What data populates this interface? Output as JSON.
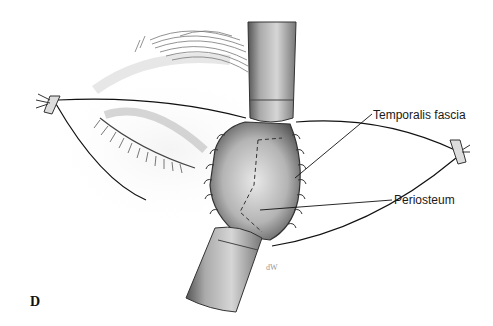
{
  "figure": {
    "panel_letter": "D",
    "labels": [
      {
        "text": "Temporalis fascia",
        "x": 373,
        "y": 108
      },
      {
        "text": "Periosteum",
        "x": 394,
        "y": 193
      }
    ],
    "colors": {
      "ink": "#1a1a1a",
      "retractor_dark": "#5a5a5a",
      "retractor_light": "#bdbdbd",
      "skin_shade": "#d8d8d8",
      "wound": "#8c8c8c"
    }
  }
}
